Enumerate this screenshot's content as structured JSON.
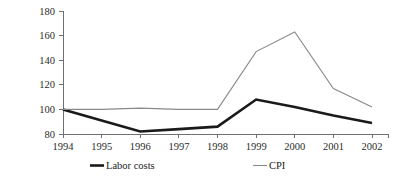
{
  "chart_data": {
    "type": "line",
    "title": "",
    "subtitle": "",
    "xlabel": "",
    "ylabel": "",
    "categories": [
      "1994",
      "1995",
      "1996",
      "1997",
      "1998",
      "1999",
      "2000",
      "2001",
      "2002"
    ],
    "x": [
      1994,
      1995,
      1996,
      1997,
      1998,
      1999,
      2000,
      2001,
      2002
    ],
    "series": [
      {
        "name": "Labor costs",
        "values": [
          100,
          91,
          82,
          84,
          86,
          108,
          102,
          95,
          89
        ],
        "color": "#1a1a1a",
        "width": 2.6
      },
      {
        "name": "CPI",
        "values": [
          100,
          100,
          101,
          100,
          100,
          147,
          163,
          117,
          102
        ],
        "color": "#8a8a8a",
        "width": 1.1
      }
    ],
    "ylim": [
      80,
      180
    ],
    "yticks": [
      80,
      100,
      120,
      140,
      160,
      180
    ],
    "ytick_labels": [
      "80",
      "100",
      "120",
      "140",
      "160",
      "180"
    ],
    "xlim": [
      1994,
      2002
    ],
    "grid": false,
    "legend_position": "bottom"
  },
  "legend": {
    "entries": [
      {
        "label": "Labor costs",
        "color": "#1a1a1a",
        "width": 2.6
      },
      {
        "label": "CPI",
        "color": "#8a8a8a",
        "width": 1.1
      }
    ]
  }
}
